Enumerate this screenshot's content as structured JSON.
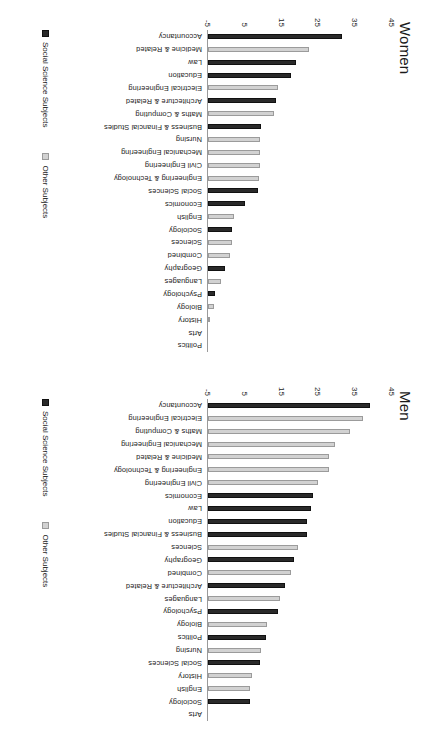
{
  "figure": {
    "orientation": "rotated-90-clockwise"
  },
  "legend": {
    "social_label": "Social Science Subjects",
    "other_label": "Other Subjects",
    "social_color": "#2a2a2a",
    "other_color": "#d2d2d2"
  },
  "axis": {
    "ticks": [
      "-5",
      "5",
      "15",
      "25",
      "35",
      "45"
    ],
    "min": -5,
    "max": 45
  },
  "chart_data": [
    {
      "type": "bar",
      "title": "Men",
      "xlabel": "",
      "ylabel": "",
      "ylim": [
        -5,
        45
      ],
      "grid": false,
      "legend_position": "bottom-left",
      "legend_entries": [
        "Social Science Subjects",
        "Other Subjects"
      ],
      "categories": [
        "Accountancy",
        "Electrical Engineering",
        "Maths & Computing",
        "Mechanical Engineering",
        "Medicine & Related",
        "Engineering & Technology",
        "Civil Engineering",
        "Economics",
        "Law",
        "Education",
        "Business & Financial Studies",
        "Sciences",
        "Geography",
        "Combined",
        "Architecture & Related",
        "Languages",
        "Psychology",
        "Biology",
        "Politics",
        "Nursing",
        "Social Sciences",
        "History",
        "English",
        "Sociology",
        "Arts"
      ],
      "groups": [
        "social",
        "other",
        "other",
        "other",
        "other",
        "other",
        "other",
        "social",
        "social",
        "social",
        "social",
        "other",
        "social",
        "other",
        "social",
        "other",
        "social",
        "other",
        "social",
        "other",
        "social",
        "other",
        "other",
        "social",
        "other"
      ],
      "values": [
        44.0,
        42.0,
        38.5,
        34.5,
        33.0,
        33.0,
        30.0,
        28.5,
        28.0,
        27.0,
        27.0,
        24.5,
        23.5,
        22.5,
        21.0,
        19.5,
        19.0,
        16.0,
        15.8,
        14.5,
        14.0,
        12.0,
        11.5,
        11.5,
        0.0
      ]
    },
    {
      "type": "bar",
      "title": "Women",
      "xlabel": "",
      "ylabel": "",
      "ylim": [
        -5,
        45
      ],
      "grid": false,
      "legend_position": "bottom-left",
      "legend_entries": [
        "Social Science Subjects",
        "Other Subjects"
      ],
      "categories": [
        "Accountancy",
        "Medicine & Related",
        "Law",
        "Education",
        "Electrical Engineering",
        "Architecture & Related",
        "Maths & Computing",
        "Business & Financial Studies",
        "Nursing",
        "Mechanical Engineering",
        "Civil Engineering",
        "Engineering & Technology",
        "Social Sciences",
        "Economics",
        "English",
        "Sociology",
        "Sciences",
        "Combined",
        "Geography",
        "Languages",
        "Psychology",
        "Biology",
        "History",
        "Arts",
        "Politics"
      ],
      "groups": [
        "social",
        "other",
        "social",
        "social",
        "other",
        "social",
        "other",
        "social",
        "other",
        "other",
        "other",
        "other",
        "social",
        "social",
        "other",
        "social",
        "other",
        "other",
        "social",
        "other",
        "social",
        "other",
        "other",
        "other",
        "social"
      ],
      "values": [
        36.5,
        27.5,
        24.0,
        22.5,
        19.0,
        18.5,
        18.0,
        14.5,
        14.0,
        14.0,
        14.0,
        13.8,
        13.5,
        10.0,
        7.0,
        6.5,
        6.5,
        6.0,
        4.5,
        3.5,
        2.0,
        1.5,
        0.5,
        0.0,
        0.0
      ]
    }
  ]
}
